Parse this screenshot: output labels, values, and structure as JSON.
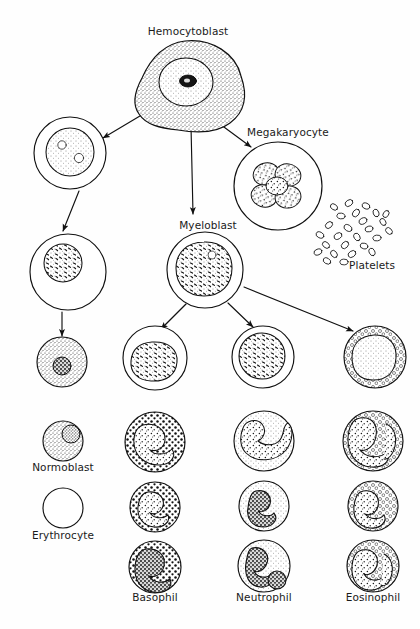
{
  "figure": {
    "domain": "biology-diagram",
    "background_color": "#ffffff",
    "ink_color": "#1a1a1a",
    "width": 420,
    "height": 629
  },
  "labels": {
    "hemocytoblast": "Hemocytoblast",
    "megakaryocyte": "Megakaryocyte",
    "platelets": "Platelets",
    "myeloblast": "Myeloblast",
    "normoblast": "Normoblast",
    "erythrocyte": "Erythrocyte",
    "basophil": "Basophil",
    "neutrophil": "Neutrophil",
    "eosinophil": "Eosinophil"
  },
  "label_positions": [
    {
      "key": "hemocytoblast",
      "x": 188,
      "y": 28,
      "align": "center"
    },
    {
      "key": "megakaryocyte",
      "x": 288,
      "y": 128,
      "align": "center"
    },
    {
      "key": "platelets",
      "x": 350,
      "y": 262,
      "align": "left"
    },
    {
      "key": "myeloblast",
      "x": 208,
      "y": 221,
      "align": "center"
    },
    {
      "key": "normoblast",
      "x": 63,
      "y": 462,
      "align": "center"
    },
    {
      "key": "erythrocyte",
      "x": 63,
      "y": 530,
      "align": "center"
    },
    {
      "key": "basophil",
      "x": 155,
      "y": 592,
      "align": "center"
    },
    {
      "key": "neutrophil",
      "x": 264,
      "y": 592,
      "align": "center"
    },
    {
      "key": "eosinophil",
      "x": 373,
      "y": 592,
      "align": "center"
    }
  ],
  "cells": [
    {
      "name": "hemocytoblast-cell",
      "cx": 185,
      "cy": 86,
      "r": 46,
      "shape": "blob",
      "cytoplasm": "stipple-medium",
      "nucleus": {
        "cx": 186,
        "cy": 82,
        "r": 26,
        "fill": "light-stipple",
        "nucleolus": true
      }
    },
    {
      "name": "proerythroblast-cell",
      "cx": 70,
      "cy": 153,
      "r": 36,
      "shape": "circle",
      "cytoplasm": "clear",
      "nucleus": {
        "cx": 70,
        "cy": 152,
        "r": 24,
        "fill": "stipple-light",
        "vacuoles": 2
      }
    },
    {
      "name": "erythroblast-cell",
      "cx": 68,
      "cy": 272,
      "r": 38,
      "shape": "circle",
      "cytoplasm": "clear",
      "nucleus": {
        "cx": 63,
        "cy": 263,
        "r": 19,
        "fill": "stipple-chromatin"
      }
    },
    {
      "name": "normoblast-stage-cell",
      "cx": 62,
      "cy": 362,
      "r": 25,
      "shape": "circle",
      "cytoplasm": "stipple-medium",
      "nucleus": {
        "cx": 62,
        "cy": 366,
        "r": 9,
        "fill": "dense-dark"
      }
    },
    {
      "name": "megakaryocyte-cell",
      "cx": 278,
      "cy": 186,
      "r": 44,
      "shape": "circle",
      "cytoplasm": "clear",
      "nucleus": {
        "cx": 277,
        "cy": 185,
        "r": 22,
        "fill": "lobulated-multilobe"
      }
    },
    {
      "name": "platelets-cluster",
      "cx": 356,
      "cy": 230,
      "r": 40,
      "shape": "scatter-ovals",
      "count": 26
    },
    {
      "name": "myeloblast-cell",
      "cx": 205,
      "cy": 270,
      "r": 38,
      "shape": "circle",
      "cytoplasm": "clear",
      "nucleus": {
        "cx": 204,
        "cy": 268,
        "r": 26,
        "fill": "stipple-chromatin"
      }
    },
    {
      "name": "basophil-myelocyte-cell",
      "cx": 155,
      "cy": 358,
      "r": 32,
      "shape": "circle",
      "cytoplasm": "clear",
      "nucleus": {
        "cx": 152,
        "cy": 362,
        "r": 20,
        "fill": "stipple-light"
      }
    },
    {
      "name": "neutrophil-myelocyte-cell",
      "cx": 263,
      "cy": 357,
      "r": 31,
      "shape": "circle",
      "cytoplasm": "clear",
      "nucleus": {
        "cx": 262,
        "cy": 356,
        "r": 23,
        "fill": "stipple-chromatin"
      }
    },
    {
      "name": "eosinophil-myelocyte-cell",
      "cx": 375,
      "cy": 357,
      "r": 31,
      "shape": "circle",
      "cytoplasm": "granules-open-circles",
      "nucleus": {
        "cx": 374,
        "cy": 358,
        "r": 22,
        "fill": "stipple-light"
      }
    },
    {
      "name": "normoblast-legend-cell",
      "cx": 63,
      "cy": 441,
      "r": 20,
      "shape": "circle",
      "cytoplasm": "stipple-medium",
      "nucleus": {
        "cx": 70,
        "cy": 434,
        "r": 9,
        "fill": "stipple-dense"
      }
    },
    {
      "name": "erythrocyte-legend-cell",
      "cx": 63,
      "cy": 508,
      "r": 20,
      "shape": "circle",
      "cytoplasm": "clear",
      "nucleus": null
    },
    {
      "name": "basophil-band-cell",
      "cx": 155,
      "cy": 442,
      "r": 30,
      "shape": "circle",
      "cytoplasm": "granules-dark-dots",
      "nucleus": {
        "cx": 155,
        "cy": 446,
        "r": 22,
        "fill": "bilobed"
      }
    },
    {
      "name": "neutrophil-band-cell",
      "cx": 264,
      "cy": 441,
      "r": 30,
      "shape": "circle",
      "cytoplasm": "stipple-light",
      "nucleus": {
        "cx": 264,
        "cy": 438,
        "r": 23,
        "fill": "horseshoe-band"
      }
    },
    {
      "name": "eosinophil-band-cell",
      "cx": 373,
      "cy": 441,
      "r": 30,
      "shape": "circle",
      "cytoplasm": "granules-open-circles",
      "nucleus": {
        "cx": 370,
        "cy": 438,
        "r": 22,
        "fill": "bilobed"
      }
    },
    {
      "name": "basophil-mid-cell",
      "cx": 155,
      "cy": 507,
      "r": 25,
      "shape": "circle",
      "cytoplasm": "granules-dark-dots",
      "nucleus": {
        "cx": 155,
        "cy": 507,
        "r": 16,
        "fill": "bilobed"
      }
    },
    {
      "name": "neutrophil-mid-cell",
      "cx": 264,
      "cy": 506,
      "r": 25,
      "shape": "circle",
      "cytoplasm": "stipple-light",
      "nucleus": {
        "cx": 263,
        "cy": 505,
        "r": 16,
        "fill": "segmented-dark"
      }
    },
    {
      "name": "eosinophil-mid-cell",
      "cx": 373,
      "cy": 506,
      "r": 25,
      "shape": "circle",
      "cytoplasm": "granules-open-circles",
      "nucleus": {
        "cx": 373,
        "cy": 505,
        "r": 17,
        "fill": "bilobed"
      }
    },
    {
      "name": "basophil-mature-cell",
      "cx": 155,
      "cy": 567,
      "r": 26,
      "shape": "circle",
      "cytoplasm": "granules-dark-dots",
      "nucleus": {
        "cx": 153,
        "cy": 568,
        "r": 18,
        "fill": "multi-lobed-dark"
      }
    },
    {
      "name": "neutrophil-mature-cell",
      "cx": 264,
      "cy": 566,
      "r": 26,
      "shape": "circle",
      "cytoplasm": "stipple-light",
      "nucleus": {
        "cx": 262,
        "cy": 564,
        "r": 18,
        "fill": "segmented-3lobe"
      }
    },
    {
      "name": "eosinophil-mature-cell",
      "cx": 373,
      "cy": 566,
      "r": 26,
      "shape": "circle",
      "cytoplasm": "granules-open-circles",
      "nucleus": {
        "cx": 372,
        "cy": 565,
        "r": 18,
        "fill": "bilobed"
      }
    }
  ],
  "arrows": [
    {
      "name": "arrow-hemocytoblast-to-erythroid",
      "from": [
        150,
        110
      ],
      "to": [
        101,
        139
      ]
    },
    {
      "name": "arrow-hemocytoblast-to-myeloblast",
      "from": [
        191,
        125
      ],
      "to": [
        193,
        216
      ]
    },
    {
      "name": "arrow-hemocytoblast-to-megakaryocyte",
      "from": [
        207,
        116
      ],
      "to": [
        252,
        148
      ]
    },
    {
      "name": "arrow-erythroid-1-to-2",
      "from": [
        78,
        190
      ],
      "to": [
        62,
        232
      ]
    },
    {
      "name": "arrow-erythroid-2-to-normoblast",
      "from": [
        62,
        311
      ],
      "to": [
        62,
        336
      ]
    },
    {
      "name": "arrow-myeloblast-to-basophil",
      "from": [
        185,
        305
      ],
      "to": [
        160,
        330
      ]
    },
    {
      "name": "arrow-myeloblast-to-neutrophil",
      "from": [
        228,
        303
      ],
      "to": [
        254,
        328
      ]
    },
    {
      "name": "arrow-myeloblast-to-eosinophil",
      "from": [
        243,
        286
      ],
      "to": [
        354,
        332
      ]
    }
  ]
}
